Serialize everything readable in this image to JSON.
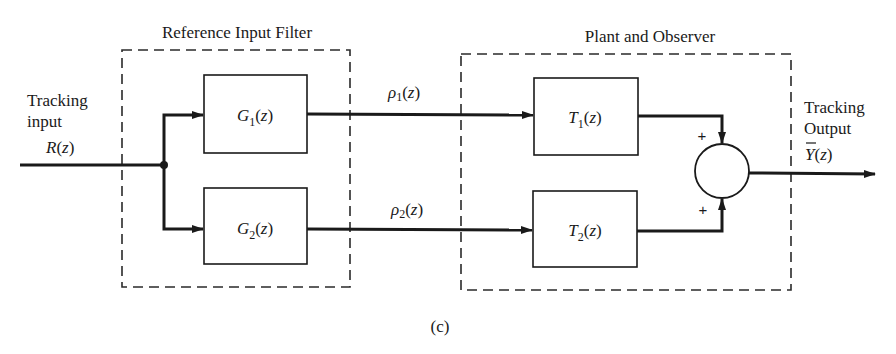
{
  "figure": {
    "caption": "(c)",
    "groups": {
      "reference_filter": {
        "title": "Reference Input Filter"
      },
      "plant_observer": {
        "title": "Plant and Observer"
      }
    },
    "input": {
      "line1": "Tracking",
      "line2": "input",
      "signal_main": "R",
      "signal_arg": "(z)"
    },
    "output": {
      "line1": "Tracking",
      "line2": "Output",
      "signal_main": "Y",
      "signal_arg": "(z)"
    },
    "blocks": [
      {
        "id": "G1",
        "main": "G",
        "sub": "1",
        "arg": "(z)"
      },
      {
        "id": "G2",
        "main": "G",
        "sub": "2",
        "arg": "(z)"
      },
      {
        "id": "T1",
        "main": "T",
        "sub": "1",
        "arg": "(z)"
      },
      {
        "id": "T2",
        "main": "T",
        "sub": "2",
        "arg": "(z)"
      }
    ],
    "signals": [
      {
        "id": "rho1",
        "main": "ρ",
        "sub": "1",
        "arg": "(z)"
      },
      {
        "id": "rho2",
        "main": "ρ",
        "sub": "2",
        "arg": "(z)"
      }
    ],
    "summer": {
      "sign_top": "+",
      "sign_bottom": "+"
    }
  }
}
